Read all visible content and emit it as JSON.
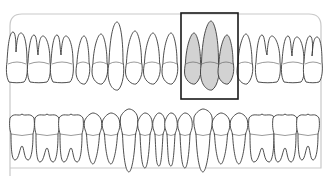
{
  "diagram": {
    "colors": {
      "outline": "#3a3a3a",
      "selected_fill": "#d2d2d2",
      "frame": "#c9c9c9",
      "selection_box": "#1a1a1a"
    },
    "upper_row": {
      "teeth": [
        {
          "x": 17,
          "w": 20,
          "type": "molar",
          "root_top": 32
        },
        {
          "x": 39,
          "w": 22,
          "type": "molar",
          "root_top": 35
        },
        {
          "x": 62,
          "w": 22,
          "type": "molar",
          "root_top": 35
        },
        {
          "x": 83,
          "w": 14,
          "type": "premolar",
          "root_top": 36
        },
        {
          "x": 100,
          "w": 16,
          "type": "premolar",
          "root_top": 34
        },
        {
          "x": 116,
          "w": 16,
          "type": "canine",
          "root_top": 22
        },
        {
          "x": 134,
          "w": 17,
          "type": "incisor",
          "root_top": 31
        },
        {
          "x": 152,
          "w": 17,
          "type": "incisor",
          "root_top": 33
        },
        {
          "x": 170,
          "w": 16,
          "type": "incisor",
          "root_top": 33
        },
        {
          "x": 193,
          "w": 17,
          "type": "incisor",
          "root_top": 33,
          "selected": true
        },
        {
          "x": 210,
          "w": 19,
          "type": "canine",
          "root_top": 21,
          "selected": true
        },
        {
          "x": 226,
          "w": 16,
          "type": "premolar",
          "root_top": 35,
          "selected": true
        },
        {
          "x": 245,
          "w": 16,
          "type": "premolar",
          "root_top": 34
        },
        {
          "x": 268,
          "w": 24,
          "type": "molar",
          "root_top": 35
        },
        {
          "x": 293,
          "w": 22,
          "type": "molar",
          "root_top": 36
        },
        {
          "x": 313,
          "w": 18,
          "type": "molar",
          "root_top": 36
        }
      ]
    },
    "lower_row": {
      "teeth": [
        {
          "x": 22,
          "w": 24,
          "type": "molar",
          "root_bottom": 160
        },
        {
          "x": 47,
          "w": 24,
          "type": "molar",
          "root_bottom": 162
        },
        {
          "x": 71,
          "w": 24,
          "type": "molar",
          "root_bottom": 162
        },
        {
          "x": 93,
          "w": 17,
          "type": "premolar",
          "root_bottom": 164
        },
        {
          "x": 111,
          "w": 17,
          "type": "premolar",
          "root_bottom": 164
        },
        {
          "x": 129,
          "w": 17,
          "type": "canine",
          "root_bottom": 172
        },
        {
          "x": 145,
          "w": 14,
          "type": "incisor",
          "root_bottom": 168
        },
        {
          "x": 159,
          "w": 12,
          "type": "incisor",
          "root_bottom": 166
        },
        {
          "x": 171,
          "w": 12,
          "type": "incisor",
          "root_bottom": 166
        },
        {
          "x": 185,
          "w": 14,
          "type": "incisor",
          "root_bottom": 168
        },
        {
          "x": 203,
          "w": 18,
          "type": "canine",
          "root_bottom": 172
        },
        {
          "x": 221,
          "w": 17,
          "type": "premolar",
          "root_bottom": 164
        },
        {
          "x": 239,
          "w": 17,
          "type": "premolar",
          "root_bottom": 164
        },
        {
          "x": 262,
          "w": 26,
          "type": "molar",
          "root_bottom": 162
        },
        {
          "x": 285,
          "w": 24,
          "type": "molar",
          "root_bottom": 162
        },
        {
          "x": 308,
          "w": 22,
          "type": "molar",
          "root_bottom": 160
        }
      ]
    },
    "selection_box": {
      "x": 181,
      "y": 13,
      "w": 57,
      "h": 86
    }
  }
}
